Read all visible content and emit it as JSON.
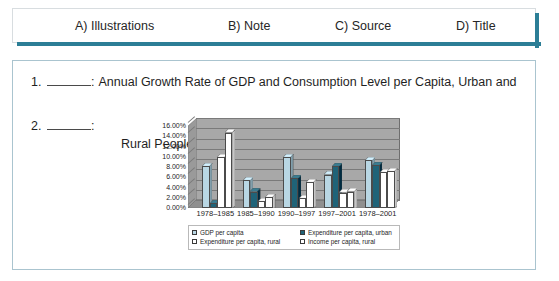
{
  "options_bar": {
    "accent_color": "#2c7e96",
    "items": [
      {
        "label": "A) Illustrations"
      },
      {
        "label": "B) Note"
      },
      {
        "label": "C) Source"
      },
      {
        "label": "D) Title"
      }
    ]
  },
  "question_panel": {
    "items": [
      {
        "number": "1.",
        "blank": "",
        "colon": ":",
        "text_line1": "Annual Growth Rate of GDP and Consumption Level per Capita, Urban and",
        "text_line2": "Rural People"
      },
      {
        "number": "2.",
        "blank": "",
        "colon": ":",
        "text_line1": "",
        "text_line2": ""
      }
    ]
  },
  "chart_data": {
    "type": "bar",
    "title": "",
    "subtitle": "",
    "xlabel": "",
    "ylabel": "",
    "ylim": [
      0,
      16
    ],
    "ytick_labels": [
      "16.00%",
      "14.00%",
      "12.00%",
      "10.00%",
      "8.00%",
      "6.00%",
      "4.00%",
      "2.00%",
      "0.00%"
    ],
    "ytick_values": [
      16,
      14,
      12,
      10,
      8,
      6,
      4,
      2,
      0
    ],
    "grid": true,
    "legend_position": "bottom",
    "three_d": true,
    "categories": [
      "1978–1985",
      "1985–1990",
      "1990–1997",
      "1997–2001",
      "1978–2001"
    ],
    "series": [
      {
        "name": "GDP per capita",
        "color": "#b9d7e4",
        "values": [
          8.2,
          5.4,
          10.0,
          6.5,
          9.4
        ]
      },
      {
        "name": "Expenditure per capita, urban",
        "color": "#1f6378",
        "values": [
          1.0,
          3.2,
          5.8,
          8.2,
          8.4
        ]
      },
      {
        "name": "Expenditure per capita, rural",
        "color": "#ffffff",
        "values": [
          10.0,
          1.3,
          2.0,
          3.0,
          7.0
        ]
      },
      {
        "name": "Income per capita, rural",
        "color": "#ffffff",
        "values": [
          14.7,
          2.2,
          5.0,
          3.2,
          7.2
        ]
      }
    ]
  }
}
